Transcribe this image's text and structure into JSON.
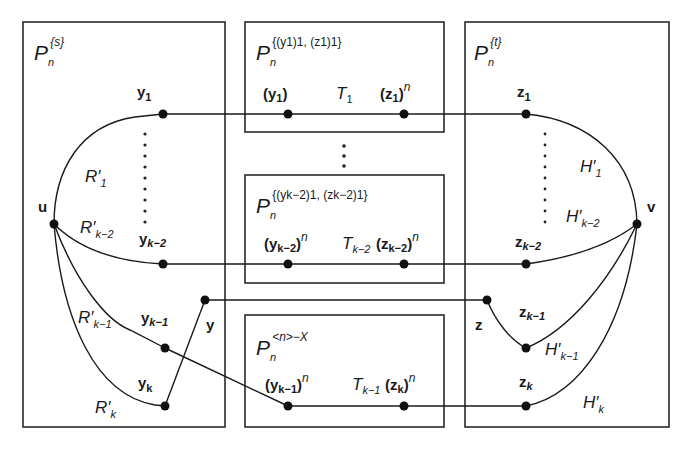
{
  "diagram": {
    "boxes": {
      "left": {
        "title_main": "P",
        "title_sub": "n",
        "title_sup": "{s}"
      },
      "mid1": {
        "title_main": "P",
        "title_sub": "n",
        "title_sup": "{(y1)1, (z1)1}"
      },
      "mid2": {
        "title_main": "P",
        "title_sub": "n",
        "title_sup": "{(yk−2)1, (zk−2)1}"
      },
      "mid3": {
        "title_main": "P",
        "title_sub": "n",
        "title_sup": "<n>−X"
      },
      "right": {
        "title_main": "P",
        "title_sub": "n",
        "title_sup": "{t}"
      }
    },
    "vertices": {
      "u": "u",
      "v": "v",
      "y": "y",
      "z": "z",
      "y1": {
        "base": "y",
        "sub": "1"
      },
      "yk2": {
        "base": "y",
        "sub": "k−2"
      },
      "yk1": {
        "base": "y",
        "sub": "k−1"
      },
      "yk": {
        "base": "y",
        "sub": "k"
      },
      "z1": {
        "base": "z",
        "sub": "1"
      },
      "zk2": {
        "base": "z",
        "sub": "k−2"
      },
      "zk1": {
        "base": "z",
        "sub": "k−1"
      },
      "zk": {
        "base": "z",
        "sub": "k"
      }
    },
    "mid_labels": {
      "y1_n": {
        "open": "(",
        "base": "y",
        "sub": "1",
        "close": ")",
        "sup": ""
      },
      "T1": {
        "base": "T",
        "sub": "1"
      },
      "z1_n": {
        "open": "(",
        "base": "z",
        "sub": "1",
        "close": ")",
        "sup": "n"
      },
      "yk2_n": {
        "open": "(",
        "base": "y",
        "sub": "k−2",
        "close": ")",
        "sup": "n"
      },
      "Tk2": {
        "base": "T",
        "sub": "k−2"
      },
      "zk2_n": {
        "open": "(",
        "base": "z",
        "sub": "k−2",
        "close": ")",
        "sup": "n"
      },
      "yk1_n": {
        "open": "(",
        "base": "y",
        "sub": "k−1",
        "close": ")",
        "sup": "n"
      },
      "Tk1": {
        "base": "T",
        "sub": "k−1"
      },
      "zk_n": {
        "open": "(",
        "base": "z",
        "sub": "k",
        "close": ")",
        "sup": "n"
      }
    },
    "path_labels": {
      "R1": {
        "base": "R′",
        "sub": "1"
      },
      "Rk2": {
        "base": "R′",
        "sub": "k−2"
      },
      "Rk1": {
        "base": "R′",
        "sub": "k−1"
      },
      "Rk": {
        "base": "R′",
        "sub": "k"
      },
      "H1": {
        "base": "H′",
        "sub": "1"
      },
      "Hk2": {
        "base": "H′",
        "sub": "k−2"
      },
      "Hk1": {
        "base": "H′",
        "sub": "k−1"
      },
      "Hk": {
        "base": "H′",
        "sub": "k"
      }
    },
    "colors": {
      "stroke": "#1a1a1a",
      "background": "#ffffff"
    }
  }
}
